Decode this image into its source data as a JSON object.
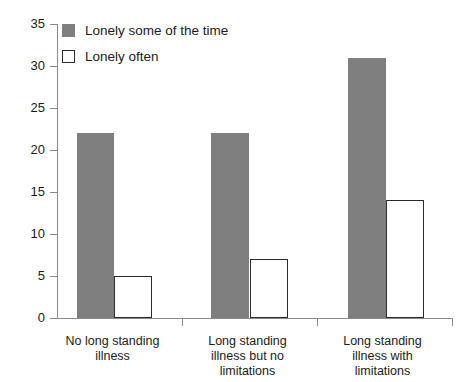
{
  "chart_data": {
    "type": "bar",
    "title": "",
    "subtitle": "",
    "xlabel": "",
    "ylabel": "",
    "ylim": [
      0,
      35
    ],
    "y_ticks": [
      0,
      5,
      10,
      15,
      20,
      25,
      30,
      35
    ],
    "grid": false,
    "legend_position": "top-left",
    "categories": [
      "No long standing illness",
      "Long standing illness but no limitations",
      "Long standing illness with limitations"
    ],
    "category_lines": [
      [
        "No long standing",
        "illness"
      ],
      [
        "Long standing",
        "illness but no",
        "limitations"
      ],
      [
        "Long standing",
        "illness with",
        "limitations"
      ]
    ],
    "series": [
      {
        "name": "Lonely some of the time",
        "values": [
          22,
          22,
          31
        ],
        "style": "filled",
        "color": "#7f7f7f"
      },
      {
        "name": "Lonely often",
        "values": [
          5,
          7,
          14
        ],
        "style": "outlined",
        "color": "#ffffff",
        "border_color": "#2b2b2b"
      }
    ]
  },
  "legend": {
    "items": [
      {
        "label": "Lonely some of the time",
        "swatch": "filled-square-icon"
      },
      {
        "label": "Lonely often",
        "swatch": "outlined-square-icon"
      }
    ]
  },
  "axis": {
    "y_tick_labels": [
      "35",
      "30",
      "25",
      "20",
      "15",
      "10",
      "5",
      "0"
    ]
  },
  "colors": {
    "series_filled": "#7f7f7f",
    "series_outline": "#2b2b2b",
    "axis": "#8a8a8a",
    "text": "#1a1a1a",
    "background": "#ffffff"
  }
}
